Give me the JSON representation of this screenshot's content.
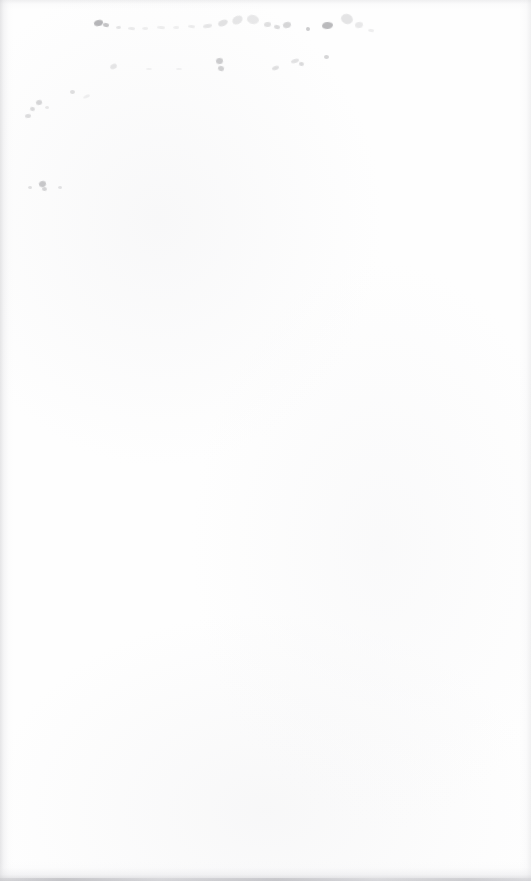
{
  "document": {
    "type": "scanned-page",
    "description": "Scanned blank page with faint residual ink traces",
    "page_width": 531,
    "page_height": 881,
    "visible_text": "",
    "legible_text_present": false,
    "background_color": "#fefefe",
    "ink_color": "#8a8a8e",
    "edge_shadow_color": "#c4c4c8"
  },
  "content": {
    "heading": "",
    "body_text": "",
    "footer": "",
    "page_number": ""
  },
  "ink_traces": {
    "note": "Faint, illegible residual marks concentrated in the upper-left quadrant",
    "rows": [
      {
        "row_label": "upper-trace-row-1",
        "y": 22,
        "marks": [
          {
            "x": 94,
            "y": 20,
            "w": 9,
            "h": 6,
            "opacity": 0.62,
            "rot": -14
          },
          {
            "x": 103,
            "y": 23,
            "w": 6,
            "h": 4,
            "opacity": 0.5,
            "rot": 8
          },
          {
            "x": 116,
            "y": 26,
            "w": 5,
            "h": 3,
            "opacity": 0.22,
            "rot": -6
          },
          {
            "x": 128,
            "y": 27,
            "w": 7,
            "h": 3,
            "opacity": 0.16,
            "rot": 4
          },
          {
            "x": 142,
            "y": 27,
            "w": 6,
            "h": 3,
            "opacity": 0.13,
            "rot": -3
          },
          {
            "x": 157,
            "y": 26,
            "w": 8,
            "h": 3,
            "opacity": 0.14,
            "rot": 5
          },
          {
            "x": 173,
            "y": 26,
            "w": 6,
            "h": 3,
            "opacity": 0.12,
            "rot": -4
          },
          {
            "x": 188,
            "y": 25,
            "w": 7,
            "h": 3,
            "opacity": 0.15,
            "rot": 6
          },
          {
            "x": 203,
            "y": 24,
            "w": 9,
            "h": 4,
            "opacity": 0.2,
            "rot": -10
          },
          {
            "x": 218,
            "y": 20,
            "w": 10,
            "h": 6,
            "opacity": 0.24,
            "rot": -22
          },
          {
            "x": 232,
            "y": 16,
            "w": 11,
            "h": 8,
            "opacity": 0.2,
            "rot": -30
          },
          {
            "x": 247,
            "y": 15,
            "w": 12,
            "h": 9,
            "opacity": 0.18,
            "rot": 12
          },
          {
            "x": 264,
            "y": 22,
            "w": 7,
            "h": 5,
            "opacity": 0.26,
            "rot": -8
          },
          {
            "x": 274,
            "y": 25,
            "w": 6,
            "h": 4,
            "opacity": 0.3,
            "rot": 10
          },
          {
            "x": 283,
            "y": 22,
            "w": 8,
            "h": 6,
            "opacity": 0.34,
            "rot": -16
          },
          {
            "x": 306,
            "y": 27,
            "w": 4,
            "h": 4,
            "opacity": 0.42,
            "rot": 0
          },
          {
            "x": 322,
            "y": 22,
            "w": 11,
            "h": 7,
            "opacity": 0.58,
            "rot": -6
          },
          {
            "x": 341,
            "y": 14,
            "w": 12,
            "h": 10,
            "opacity": 0.22,
            "rot": 18
          },
          {
            "x": 355,
            "y": 22,
            "w": 8,
            "h": 6,
            "opacity": 0.18,
            "rot": -12
          },
          {
            "x": 368,
            "y": 29,
            "w": 6,
            "h": 3,
            "opacity": 0.14,
            "rot": 6
          }
        ]
      },
      {
        "row_label": "upper-trace-row-2",
        "y": 62,
        "marks": [
          {
            "x": 110,
            "y": 64,
            "w": 7,
            "h": 5,
            "opacity": 0.2,
            "rot": -28
          },
          {
            "x": 146,
            "y": 68,
            "w": 6,
            "h": 2,
            "opacity": 0.1,
            "rot": 0
          },
          {
            "x": 176,
            "y": 68,
            "w": 6,
            "h": 2,
            "opacity": 0.1,
            "rot": 0
          },
          {
            "x": 216,
            "y": 58,
            "w": 7,
            "h": 6,
            "opacity": 0.42,
            "rot": -12
          },
          {
            "x": 218,
            "y": 66,
            "w": 6,
            "h": 5,
            "opacity": 0.38,
            "rot": 14
          },
          {
            "x": 272,
            "y": 66,
            "w": 7,
            "h": 4,
            "opacity": 0.26,
            "rot": -20
          },
          {
            "x": 291,
            "y": 59,
            "w": 8,
            "h": 4,
            "opacity": 0.24,
            "rot": -18
          },
          {
            "x": 299,
            "y": 62,
            "w": 5,
            "h": 4,
            "opacity": 0.3,
            "rot": 10
          },
          {
            "x": 324,
            "y": 55,
            "w": 5,
            "h": 4,
            "opacity": 0.34,
            "rot": 0
          }
        ]
      },
      {
        "row_label": "left-trace-cluster",
        "y": 100,
        "marks": [
          {
            "x": 70,
            "y": 90,
            "w": 5,
            "h": 4,
            "opacity": 0.26,
            "rot": 0
          },
          {
            "x": 36,
            "y": 100,
            "w": 6,
            "h": 5,
            "opacity": 0.34,
            "rot": -16
          },
          {
            "x": 30,
            "y": 107,
            "w": 5,
            "h": 4,
            "opacity": 0.3,
            "rot": 12
          },
          {
            "x": 45,
            "y": 106,
            "w": 4,
            "h": 3,
            "opacity": 0.18,
            "rot": 0
          },
          {
            "x": 25,
            "y": 114,
            "w": 6,
            "h": 4,
            "opacity": 0.28,
            "rot": -8
          },
          {
            "x": 83,
            "y": 95,
            "w": 7,
            "h": 3,
            "opacity": 0.12,
            "rot": -24
          }
        ]
      },
      {
        "row_label": "lower-left-trace-cluster",
        "y": 184,
        "marks": [
          {
            "x": 28,
            "y": 186,
            "w": 4,
            "h": 3,
            "opacity": 0.24,
            "rot": 0
          },
          {
            "x": 39,
            "y": 181,
            "w": 7,
            "h": 6,
            "opacity": 0.46,
            "rot": -18
          },
          {
            "x": 42,
            "y": 187,
            "w": 5,
            "h": 4,
            "opacity": 0.34,
            "rot": 8
          },
          {
            "x": 58,
            "y": 186,
            "w": 4,
            "h": 3,
            "opacity": 0.22,
            "rot": 0
          }
        ]
      }
    ]
  }
}
